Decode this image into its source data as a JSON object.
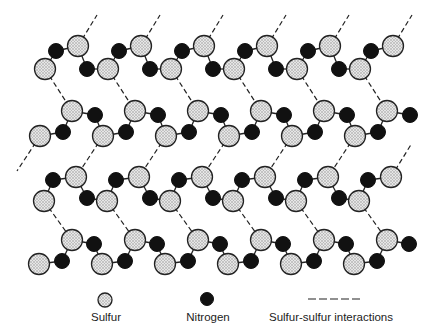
{
  "diagram": {
    "colors": {
      "sulfur_fill": "#d8d8d8",
      "sulfur_outline": "#222222",
      "nitrogen_fill": "#111111",
      "bond": "#222222"
    },
    "lattice": {
      "period_x": 63,
      "columns": 6,
      "rows": [
        {
          "name": "row-A",
          "pattern": "S_low(45,69) N(56,51) S_high(78,46) N(87,69)"
        },
        {
          "name": "row-B",
          "pattern": "S_low(40,136) N(63,132) S_high(72,111) N(95,115)"
        },
        {
          "name": "row-C",
          "pattern": "S_low(44,201) N(53,180) S_high(76,177) N(87,198)"
        },
        {
          "name": "row-D",
          "pattern": "S_low(39,264) N(62,261) S_high(72,240) N(94,244)"
        }
      ]
    }
  },
  "legend": {
    "sulfur_label": "Sulfur",
    "nitrogen_label": "Nitrogen",
    "interaction_label": "Sulfur-sulfur interactions"
  }
}
